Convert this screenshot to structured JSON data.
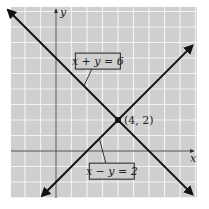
{
  "chart_data": {
    "type": "line",
    "title": "",
    "xlabel": "x",
    "ylabel": "y",
    "xlim": [
      -3,
      9
    ],
    "ylim": [
      -3,
      9.3
    ],
    "grid": true,
    "grid_step": 1,
    "series": [
      {
        "name": "x + y = 6",
        "equation": "x + y = 6",
        "x": [
          -3.1,
          8.8
        ],
        "y": [
          9.1,
          -2.8
        ],
        "arrows": "both"
      },
      {
        "name": "x − y = 2",
        "equation": "x − y = 2",
        "x": [
          -0.9,
          8.8
        ],
        "y": [
          -2.9,
          6.8
        ],
        "arrows": "both"
      }
    ],
    "annotations": [
      {
        "text": "(4, 2)",
        "x": 4,
        "y": 2,
        "type": "point"
      },
      {
        "text": "x + y = 6",
        "target_series": 0,
        "type": "callout",
        "anchor": [
          1.8,
          4.2
        ],
        "box_at": [
          2.7,
          5.8
        ]
      },
      {
        "text": "x − y = 2",
        "target_series": 1,
        "type": "callout",
        "anchor": [
          2.8,
          0.8
        ],
        "box_at": [
          3.6,
          -1.3
        ]
      }
    ],
    "colors": {
      "background": "#cfcfcf",
      "grid": "#f2f2f2",
      "axis": "#444444",
      "line": "#111111"
    }
  }
}
